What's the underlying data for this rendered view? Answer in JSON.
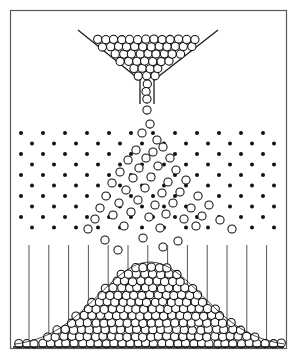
{
  "figure": {
    "alt_names": [
      "bean machine",
      "quincunx"
    ],
    "canvas": {
      "width": 297,
      "height": 360,
      "background": "#ffffff"
    },
    "frame": {
      "x": 10.5,
      "y": 10.5,
      "width": 276,
      "height": 338,
      "stroke": "#5a5a5a",
      "stroke_width": 1.2,
      "fill": "none"
    }
  },
  "palette": {
    "ink": "#111111",
    "frame_stroke": "#5a5a5a",
    "ball_fill": "#ffffff",
    "ball_stroke": "#111111",
    "peg_fill": "#111111",
    "divider_stroke": "#555555",
    "funnel_stroke": "#1a1a1a"
  },
  "hopper": {
    "label": "V-shaped feed hopper",
    "left_wall": {
      "x1": 78,
      "y1": 30,
      "x2": 140,
      "y2": 80
    },
    "right_wall": {
      "x1": 218,
      "y1": 30,
      "x2": 154,
      "y2": 80
    },
    "neck": {
      "left_x": 140,
      "right_x": 154,
      "top_y": 78,
      "bottom_y": 104,
      "width": 14
    },
    "ball_radius": 4.1,
    "ball_count": 96
  },
  "falling_balls": {
    "label": "balls dropping from neck",
    "radius": 4.1,
    "positions": [
      [
        147,
        110
      ],
      [
        150,
        124
      ],
      [
        142,
        133
      ],
      [
        157,
        140
      ],
      [
        136,
        150
      ],
      [
        153,
        152
      ],
      [
        163,
        147
      ],
      [
        128,
        160
      ],
      [
        146,
        158
      ],
      [
        170,
        158
      ],
      [
        120,
        172
      ],
      [
        139,
        168
      ],
      [
        158,
        166
      ],
      [
        176,
        170
      ],
      [
        112,
        183
      ],
      [
        133,
        178
      ],
      [
        151,
        177
      ],
      [
        168,
        182
      ],
      [
        186,
        180
      ],
      [
        106,
        196
      ],
      [
        126,
        190
      ],
      [
        145,
        188
      ],
      [
        162,
        193
      ],
      [
        180,
        192
      ],
      [
        198,
        196
      ],
      [
        100,
        208
      ],
      [
        119,
        203
      ],
      [
        138,
        200
      ],
      [
        155,
        205
      ],
      [
        173,
        203
      ],
      [
        191,
        208
      ],
      [
        209,
        205
      ],
      [
        95,
        219
      ],
      [
        113,
        215
      ],
      [
        131,
        212
      ],
      [
        149,
        217
      ],
      [
        166,
        214
      ],
      [
        184,
        219
      ],
      [
        202,
        216
      ],
      [
        220,
        220
      ],
      [
        88,
        229
      ],
      [
        124,
        226
      ],
      [
        160,
        228
      ],
      [
        196,
        226
      ],
      [
        232,
        229
      ],
      [
        105,
        240
      ],
      [
        143,
        238
      ],
      [
        178,
        241
      ],
      [
        118,
        250
      ],
      [
        163,
        247
      ]
    ]
  },
  "peg_lattice": {
    "label": "staggered peg array",
    "peg_radius": 2.0,
    "rows": 10,
    "row_spacing": 10.5,
    "column_spacing": 22,
    "first_row_y": 133,
    "x_start": 21,
    "x_end": 279,
    "stagger_offset": 11
  },
  "bins": {
    "label": "collection bins",
    "divider_count": 13,
    "divider_top_y": 245,
    "divider_bottom_y": 347,
    "first_divider_x": 29,
    "spacing": 19.8,
    "stroke": "#555555"
  },
  "chart_data": {
    "type": "bar",
    "subtitle": "Binomial approximation to the Gaussian curve",
    "xlabel": "bin",
    "ylabel": "stack height",
    "categories": [
      "1",
      "2",
      "3",
      "4",
      "5",
      "6",
      "7",
      "8",
      "9",
      "10",
      "11",
      "12",
      "13",
      "14"
    ],
    "values": [
      3,
      7,
      14,
      26,
      42,
      60,
      76,
      84,
      80,
      66,
      48,
      30,
      16,
      6
    ],
    "ylim": [
      0,
      90
    ],
    "grid": false,
    "legend": null,
    "curve": {
      "shape": "gaussian",
      "peak_x": 150,
      "peak_y": 262,
      "baseline_y": 347,
      "sigma": 52,
      "amplitude": 85
    },
    "pile_ball_radius": 4.1,
    "pile_ball_count": 558
  },
  "baseline": {
    "label": "floor line",
    "x1": 13,
    "y1": 347,
    "x2": 284,
    "y2": 347
  }
}
